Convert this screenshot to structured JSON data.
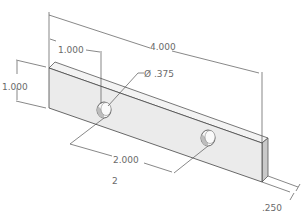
{
  "drawing": {
    "title": "Rectangular plate with two holes (isometric)",
    "colors": {
      "background": "#ffffff",
      "front_face": "#ececec",
      "top_face": "#f2f2f2",
      "side_face": "#c8c8c8",
      "edge": "#444444",
      "dimension_line": "#555555",
      "dimension_text": "#6a6a6a"
    },
    "dimensions": {
      "overall_length": "4.000",
      "hole_offset": "1.000",
      "height": "1.000",
      "hole_diameter": "Ø .375",
      "hole_spacing": "2.000",
      "thickness": ".250"
    },
    "part_label": "2"
  }
}
